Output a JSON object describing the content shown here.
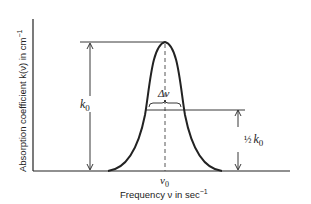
{
  "diagram": {
    "type": "absorption-line-profile",
    "y_axis_label": "Absorption coefficient k(ν) in cm",
    "y_axis_label_sup": "−1",
    "x_axis_label": "Frequency ν in sec",
    "x_axis_label_sup": "−1",
    "peak_label": "k",
    "peak_label_sub": "0",
    "center_label": "ν",
    "center_label_sub": "0",
    "width_label": "Δν",
    "half_label_frac": "½",
    "half_label_k": "k",
    "half_label_sub": "0",
    "colors": {
      "line": "#222222",
      "background": "#ffffff"
    }
  }
}
